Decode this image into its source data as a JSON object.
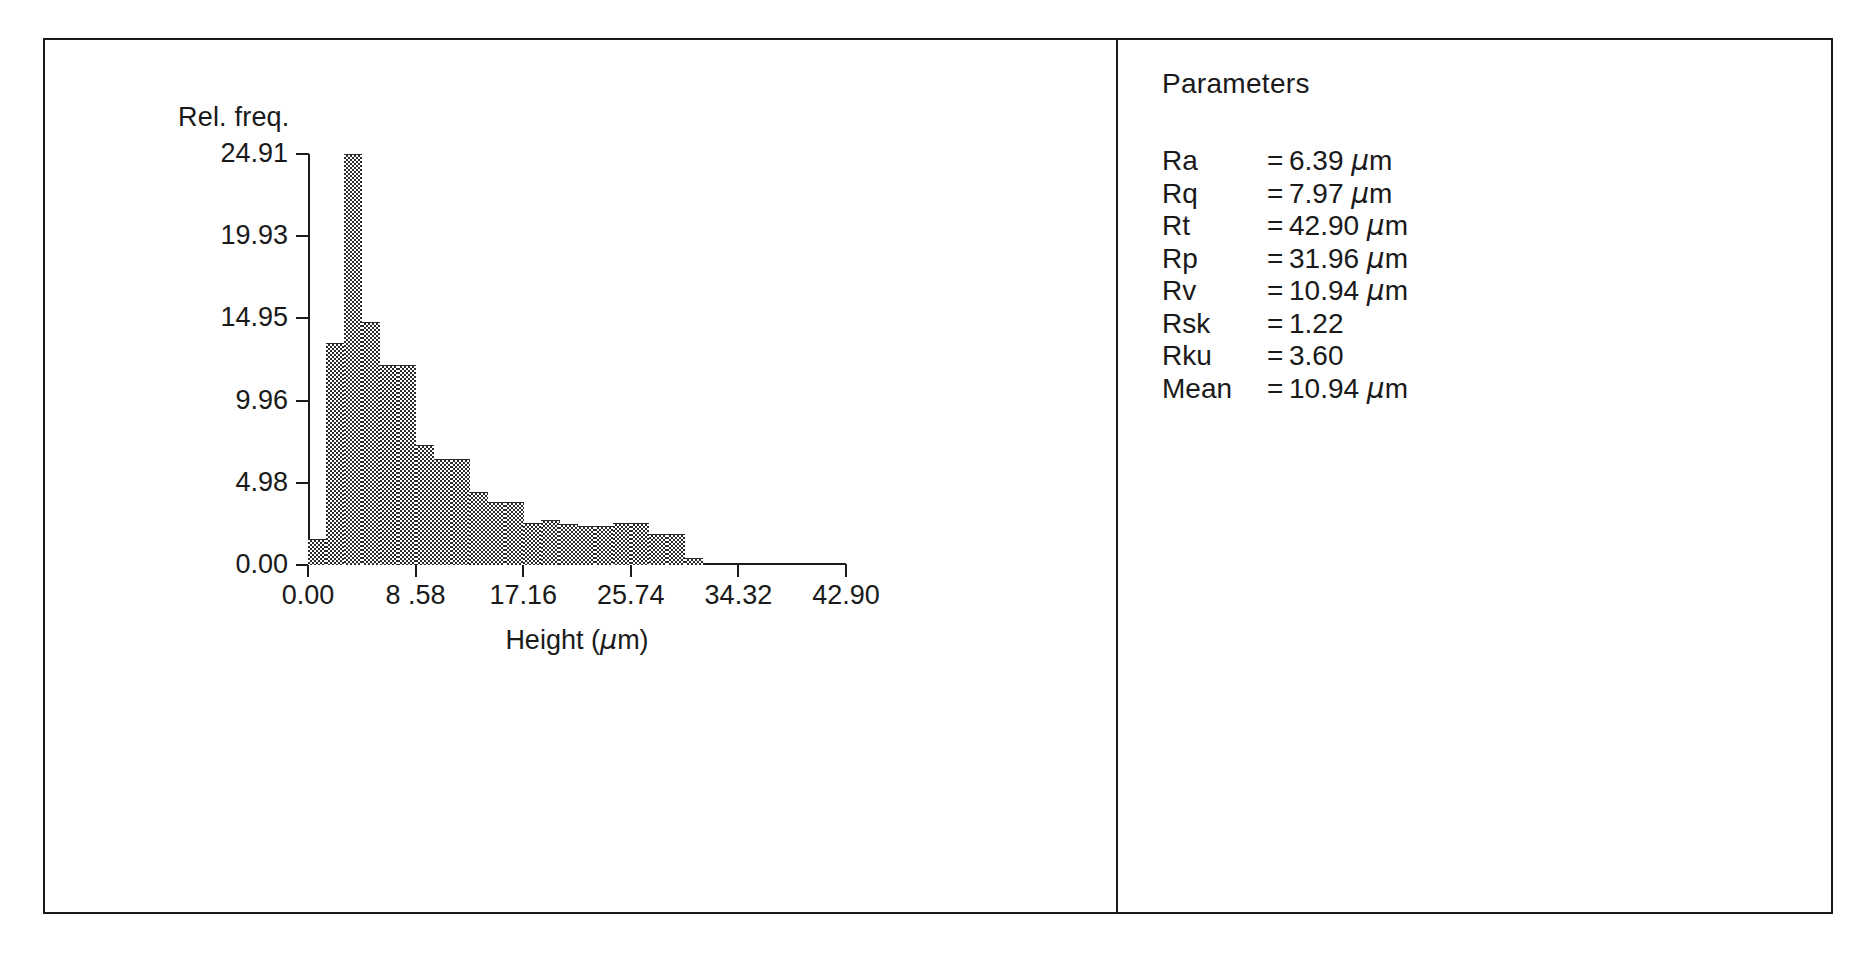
{
  "figure": {
    "panels": [
      "histogram",
      "parameters"
    ]
  },
  "chart_data": {
    "type": "bar",
    "title": "",
    "xlabel": "Height (μm)",
    "ylabel": "Rel. freq.",
    "xlabel_text": "Height",
    "xlabel_unit": "(µm)",
    "ylim": [
      0.0,
      24.91
    ],
    "xlim": [
      0.0,
      42.9
    ],
    "grid": false,
    "legend": "none",
    "ytick_labels": [
      "0.00",
      "4.98",
      "9.96",
      "14.95",
      "19.93",
      "24.91"
    ],
    "ytick_values": [
      0.0,
      4.98,
      9.96,
      14.95,
      19.93,
      24.91
    ],
    "xtick_labels": [
      "0.00",
      "8 .58",
      "17.16",
      "25.74",
      "34.32",
      "42.90"
    ],
    "xtick_values": [
      0.0,
      8.58,
      17.16,
      25.74,
      34.32,
      42.9
    ],
    "bin_width": 1.43,
    "bin_edges": [
      0.0,
      1.43,
      2.86,
      4.29,
      5.72,
      7.15,
      8.58,
      10.01,
      11.44,
      12.87,
      14.3,
      15.73,
      17.16,
      18.59,
      20.02,
      21.45,
      22.88,
      24.31,
      25.74,
      27.17,
      28.6,
      30.03,
      31.46,
      32.89,
      34.32,
      35.75,
      37.18
    ],
    "categories": [
      "0.00-1.43",
      "1.43-2.86",
      "2.86-4.29",
      "4.29-5.72",
      "5.72-7.15",
      "7.15-8.58",
      "8.58-10.01",
      "10.01-11.44",
      "11.44-12.87",
      "12.87-14.30",
      "14.30-15.73",
      "15.73-17.16",
      "17.16-18.59",
      "18.59-20.02",
      "20.02-21.45",
      "21.45-22.88",
      "22.88-24.31",
      "24.31-25.74",
      "25.74-27.17",
      "27.17-28.60",
      "28.60-30.03",
      "30.03-31.46",
      "31.46-32.89",
      "32.89-34.32",
      "34.32-35.75",
      "35.75-37.18"
    ],
    "values": [
      1.6,
      13.45,
      24.91,
      14.7,
      12.1,
      12.1,
      7.3,
      6.4,
      6.4,
      4.4,
      3.8,
      3.8,
      2.55,
      2.7,
      2.5,
      2.35,
      2.35,
      2.55,
      2.55,
      1.9,
      1.9,
      0.4,
      0.0,
      0.0,
      0.0,
      0.0
    ],
    "series": [
      {
        "name": "Relative frequency",
        "values": [
          1.6,
          13.45,
          24.91,
          14.7,
          12.1,
          12.1,
          7.3,
          6.4,
          6.4,
          4.4,
          3.8,
          3.8,
          2.55,
          2.7,
          2.5,
          2.35,
          2.35,
          2.55,
          2.55,
          1.9,
          1.9,
          0.4,
          0.0,
          0.0,
          0.0,
          0.0
        ]
      }
    ]
  },
  "parameters": {
    "title": "Parameters",
    "rows": [
      {
        "name": "Ra",
        "eq": "=",
        "value": "6.39",
        "unit": "µm"
      },
      {
        "name": "Rq",
        "eq": "=",
        "value": "7.97",
        "unit": "µm"
      },
      {
        "name": "Rt",
        "eq": "=",
        "value": "42.90",
        "unit": "µm"
      },
      {
        "name": "Rp",
        "eq": "=",
        "value": "31.96",
        "unit": "µm"
      },
      {
        "name": "Rv",
        "eq": "=",
        "value": "10.94",
        "unit": "µm"
      },
      {
        "name": "Rsk",
        "eq": "=",
        "value": "1.22",
        "unit": ""
      },
      {
        "name": "Rku",
        "eq": "=",
        "value": "3.60",
        "unit": ""
      },
      {
        "name": "Mean",
        "eq": "=",
        "value": "10.94",
        "unit": "µm"
      }
    ]
  },
  "colors": {
    "ink": "#1a1a1a",
    "fill": "#2b2b2b",
    "background": "#ffffff"
  }
}
